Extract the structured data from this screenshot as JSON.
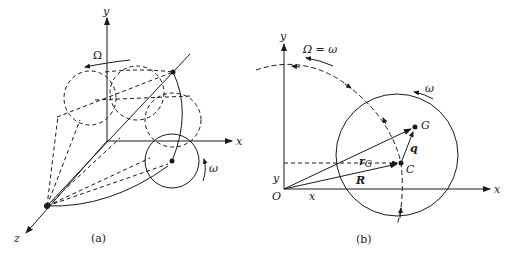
{
  "figure": {
    "panel_a": {
      "caption": "(a)",
      "axes": {
        "x": "x",
        "y": "y",
        "z": "z"
      },
      "labels": {
        "big_rotation": "Ω",
        "small_rotation": "ω"
      }
    },
    "panel_b": {
      "caption": "(b)",
      "axes": {
        "x": "x",
        "y": "y"
      },
      "labels": {
        "big_rotation": "Ω = ω",
        "small_rotation": "ω",
        "origin": "O",
        "center_point": "C",
        "mass_center": "G",
        "vector_rG": "r",
        "vector_rG_sub": "G",
        "vector_R": "R",
        "vector_q": "q",
        "coord_x": "x",
        "coord_y": "y"
      }
    },
    "colors": {
      "ink": "#1a1a1a",
      "background": "#ffffff"
    }
  }
}
